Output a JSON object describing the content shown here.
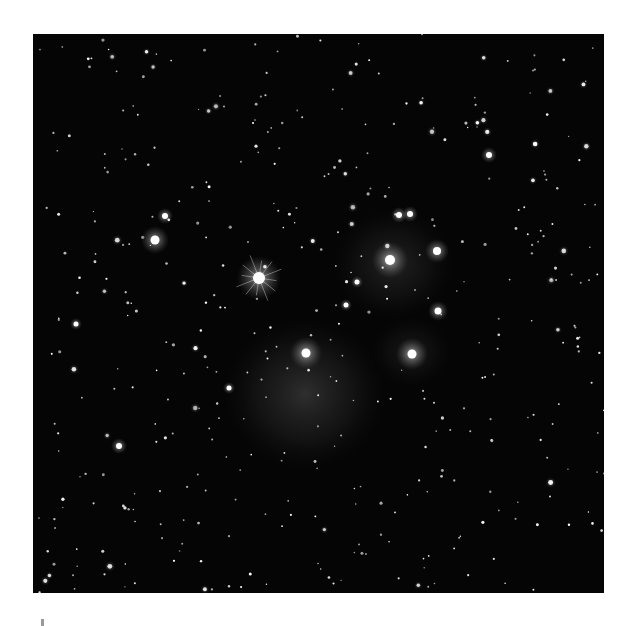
{
  "image": {
    "subject": "Pleiades star cluster",
    "style": "grayscale astrophotograph",
    "frame": {
      "x": 33,
      "y": 34,
      "width": 571,
      "height": 559
    },
    "background_color": "#050505",
    "star_color": "#ffffff",
    "nebula_color": "#8a8a8a",
    "nebulae": [
      {
        "x": 272,
        "y": 360,
        "rx": 80,
        "ry": 75,
        "opacity": 0.28
      },
      {
        "x": 360,
        "y": 230,
        "rx": 60,
        "ry": 55,
        "opacity": 0.2
      },
      {
        "x": 378,
        "y": 318,
        "rx": 40,
        "ry": 35,
        "opacity": 0.14
      }
    ],
    "bright_stars": [
      {
        "x": 226,
        "y": 244,
        "r": 6,
        "glow": 22,
        "spikes": true
      },
      {
        "x": 357,
        "y": 226,
        "r": 5,
        "glow": 18,
        "spikes": false
      },
      {
        "x": 404,
        "y": 217,
        "r": 4,
        "glow": 12,
        "spikes": false
      },
      {
        "x": 273,
        "y": 319,
        "r": 4.5,
        "glow": 16,
        "spikes": false
      },
      {
        "x": 379,
        "y": 320,
        "r": 4.5,
        "glow": 16,
        "spikes": false
      },
      {
        "x": 122,
        "y": 206,
        "r": 4.5,
        "glow": 14,
        "spikes": false
      },
      {
        "x": 405,
        "y": 277,
        "r": 3.5,
        "glow": 10,
        "spikes": false
      },
      {
        "x": 132,
        "y": 182,
        "r": 3,
        "glow": 8,
        "spikes": false
      },
      {
        "x": 366,
        "y": 181,
        "r": 3,
        "glow": 8,
        "spikes": false
      },
      {
        "x": 377,
        "y": 180,
        "r": 3,
        "glow": 8,
        "spikes": false
      },
      {
        "x": 456,
        "y": 121,
        "r": 3,
        "glow": 8,
        "spikes": false
      },
      {
        "x": 86,
        "y": 412,
        "r": 3,
        "glow": 8,
        "spikes": false
      },
      {
        "x": 324,
        "y": 248,
        "r": 2.5,
        "glow": 6,
        "spikes": false
      },
      {
        "x": 313,
        "y": 271,
        "r": 2.5,
        "glow": 6,
        "spikes": false
      },
      {
        "x": 196,
        "y": 354,
        "r": 2.5,
        "glow": 6,
        "spikes": false
      },
      {
        "x": 43,
        "y": 290,
        "r": 2.5,
        "glow": 6,
        "spikes": false
      }
    ],
    "faint_star_count": 420
  },
  "caption": {
    "text": ""
  }
}
